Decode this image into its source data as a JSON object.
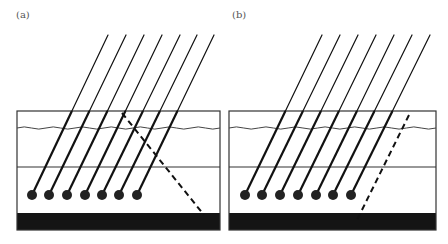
{
  "figure": {
    "panels": [
      {
        "label": "(a)",
        "box": {
          "x1": 17,
          "y1": 111,
          "x2": 220,
          "y2": 230
        },
        "wave_y": 128,
        "middle_line_y": 167,
        "slab": {
          "y1": 213,
          "y2": 230
        },
        "rods": {
          "count": 7,
          "dots_x": [
            32,
            49,
            67,
            85,
            102,
            119,
            137
          ],
          "dot_y": 195,
          "tops_x": [
            108,
            126,
            144,
            162,
            180,
            197,
            214
          ],
          "top_y": 35
        },
        "dashed_line": {
          "x1": 122,
          "y1": 113,
          "x2": 204,
          "y2": 215,
          "direction": "down-right"
        }
      },
      {
        "label": "(b)",
        "box": {
          "x1": 229,
          "y1": 111,
          "x2": 436,
          "y2": 230
        },
        "wave_y": 128,
        "middle_line_y": 167,
        "slab": {
          "y1": 213,
          "y2": 230
        },
        "rods": {
          "count": 7,
          "dots_x": [
            245,
            262,
            280,
            298,
            316,
            333,
            351
          ],
          "dot_y": 195,
          "tops_x": [
            322,
            340,
            358,
            376,
            394,
            412,
            430
          ],
          "top_y": 35
        },
        "dashed_line": {
          "x1": 409,
          "y1": 115,
          "x2": 356,
          "y2": 222,
          "direction": "down-left"
        }
      }
    ],
    "colors": {
      "stroke": "#111111",
      "slab": "#141414",
      "box": "#333333",
      "label": "#555555"
    }
  }
}
